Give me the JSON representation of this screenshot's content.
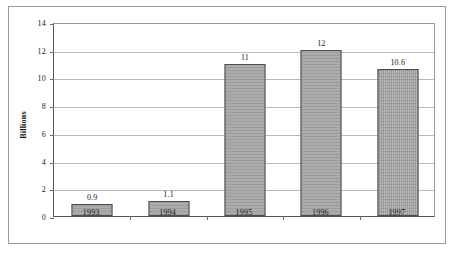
{
  "chart_data": {
    "type": "bar",
    "title": "",
    "subtitle": "",
    "xlabel": "",
    "ylabel": "Billions",
    "categories": [
      "1993",
      "1994",
      "1995",
      "1996",
      "1997"
    ],
    "values": [
      0.9,
      1.1,
      11,
      12,
      10.6
    ],
    "data_labels": [
      "0.9",
      "1.1",
      "11",
      "12",
      "10.6"
    ],
    "ylim": [
      0,
      14
    ],
    "ytick_step": 2,
    "ytick_labels": [
      "0",
      "2",
      "4",
      "6",
      "8",
      "10",
      "12",
      "14"
    ],
    "grid": "horizontal",
    "legend": "none",
    "bar_color": "#9d9d9d",
    "bar_border_color": "#4d4d4d",
    "gridline_color": "#b9b9b9",
    "axis_color": "#555555",
    "plot_background": "#ffffff",
    "frame_border_color": "#9a9a9a"
  }
}
